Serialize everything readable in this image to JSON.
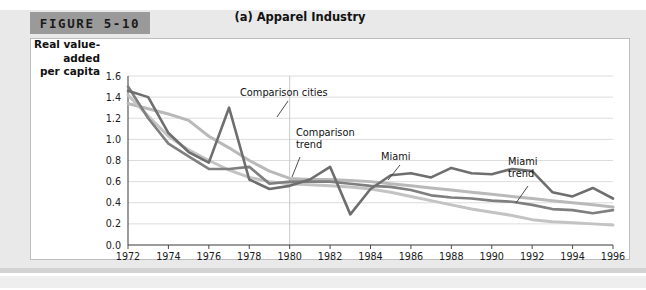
{
  "figure": {
    "tab_label": "FIGURE 5-10"
  },
  "chart_data": {
    "type": "line",
    "title": "(a) Apparel Industry",
    "xlabel": "",
    "ylabel": "Real value-added per capita",
    "ylabel_lines": [
      "Real value-",
      "added",
      "per capita"
    ],
    "xlim": [
      1972,
      1996
    ],
    "ylim": [
      0.0,
      1.6
    ],
    "ytick_step": 0.2,
    "xtick_step": 2,
    "grid": true,
    "grid_axis": "y",
    "legend_position": "inline-annotations",
    "yticks": [
      "1.6",
      "1.4",
      "1.2",
      "1.0",
      "0.8",
      "0.6",
      "0.4",
      "0.2",
      "0.0"
    ],
    "xticks": [
      "1972",
      "1974",
      "1976",
      "1978",
      "1980",
      "1982",
      "1984",
      "1986",
      "1988",
      "1990",
      "1992",
      "1994",
      "1996"
    ],
    "reference_line": {
      "x": 1980,
      "label": ""
    },
    "x": [
      1972,
      1973,
      1974,
      1975,
      1976,
      1977,
      1978,
      1979,
      1980,
      1981,
      1982,
      1983,
      1984,
      1985,
      1986,
      1987,
      1988,
      1989,
      1990,
      1991,
      1992,
      1993,
      1994,
      1995,
      1996
    ],
    "series": [
      {
        "name": "Comparison cities",
        "color": "#7f7f7f",
        "width": 2.6,
        "values": [
          1.5,
          1.2,
          0.96,
          0.84,
          0.72,
          0.72,
          0.74,
          0.58,
          0.6,
          0.6,
          0.6,
          0.58,
          0.56,
          0.55,
          0.52,
          0.47,
          0.45,
          0.44,
          0.42,
          0.41,
          0.38,
          0.34,
          0.33,
          0.3,
          0.33
        ]
      },
      {
        "name": "Miami",
        "color": "#6e6e6e",
        "width": 2.6,
        "values": [
          1.46,
          1.4,
          1.06,
          0.88,
          0.78,
          1.3,
          0.62,
          0.53,
          0.56,
          0.62,
          0.74,
          0.29,
          0.53,
          0.66,
          0.68,
          0.64,
          0.73,
          0.68,
          0.67,
          0.72,
          0.7,
          0.5,
          0.46,
          0.54,
          0.44
        ]
      },
      {
        "name": "Comparison trend",
        "color": "#b9b9b9",
        "width": 3.0,
        "values": [
          1.34,
          1.29,
          1.24,
          1.18,
          1.03,
          0.92,
          0.8,
          0.7,
          0.63,
          0.62,
          0.62,
          0.61,
          0.6,
          0.58,
          0.56,
          0.54,
          0.52,
          0.5,
          0.48,
          0.46,
          0.44,
          0.42,
          0.4,
          0.38,
          0.36
        ]
      },
      {
        "name": "Miami trend",
        "color": "#c3c3c3",
        "width": 3.0,
        "values": [
          1.42,
          1.22,
          1.03,
          0.9,
          0.8,
          0.71,
          0.64,
          0.6,
          0.58,
          0.57,
          0.56,
          0.55,
          0.53,
          0.5,
          0.46,
          0.42,
          0.38,
          0.34,
          0.31,
          0.28,
          0.24,
          0.22,
          0.21,
          0.2,
          0.19
        ]
      }
    ],
    "annotations": [
      {
        "text": "Comparison cities",
        "x": 240,
        "y": 96,
        "leader": [
          [
            288,
            101
          ],
          [
            277,
            117
          ]
        ]
      },
      {
        "text_lines": [
          "Comparison",
          "trend"
        ],
        "x": 296,
        "y": 136,
        "leader": [
          [
            300,
            157
          ],
          [
            292,
            177
          ]
        ]
      },
      {
        "text": "Miami",
        "x": 381,
        "y": 160,
        "leader": [
          [
            400,
            165
          ],
          [
            388,
            180
          ]
        ]
      },
      {
        "text_lines": [
          "Miami",
          "trend"
        ],
        "x": 508,
        "y": 165,
        "leader": [
          [
            528,
            186
          ],
          [
            516,
            203
          ]
        ]
      }
    ]
  }
}
